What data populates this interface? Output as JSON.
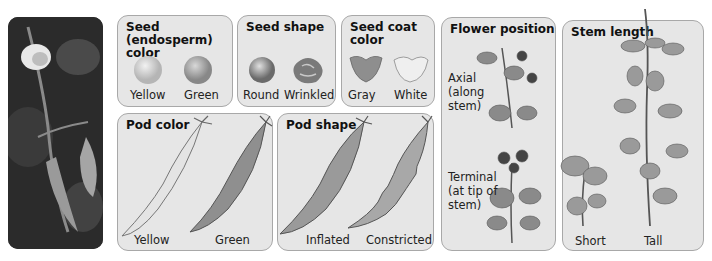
{
  "photo": {
    "subject": "pea plant with flower and pods"
  },
  "panels": {
    "seed_color": {
      "title_line1": "Seed (endosperm)",
      "title_line2": "color",
      "traits": [
        "Yellow",
        "Green"
      ]
    },
    "seed_shape": {
      "title": "Seed shape",
      "traits": [
        "Round",
        "Wrinkled"
      ]
    },
    "seed_coat": {
      "title_line1": "Seed coat",
      "title_line2": "color",
      "traits": [
        "Gray",
        "White"
      ]
    },
    "flower_position": {
      "title": "Flower position",
      "axial": {
        "line1": "Axial",
        "line2": "(along",
        "line3": "stem)"
      },
      "terminal": {
        "line1": "Terminal",
        "line2": "(at tip of",
        "line3": "stem)"
      }
    },
    "stem_length": {
      "title": "Stem length",
      "traits": [
        "Short",
        "Tall"
      ]
    },
    "pod_color": {
      "title": "Pod color",
      "traits": [
        "Yellow",
        "Green"
      ]
    },
    "pod_shape": {
      "title": "Pod shape",
      "traits": [
        "Inflated",
        "Constricted"
      ]
    }
  },
  "colors": {
    "panel_bg": "#e6e6e6",
    "panel_border": "#a8a8a8",
    "text": "#111111"
  }
}
